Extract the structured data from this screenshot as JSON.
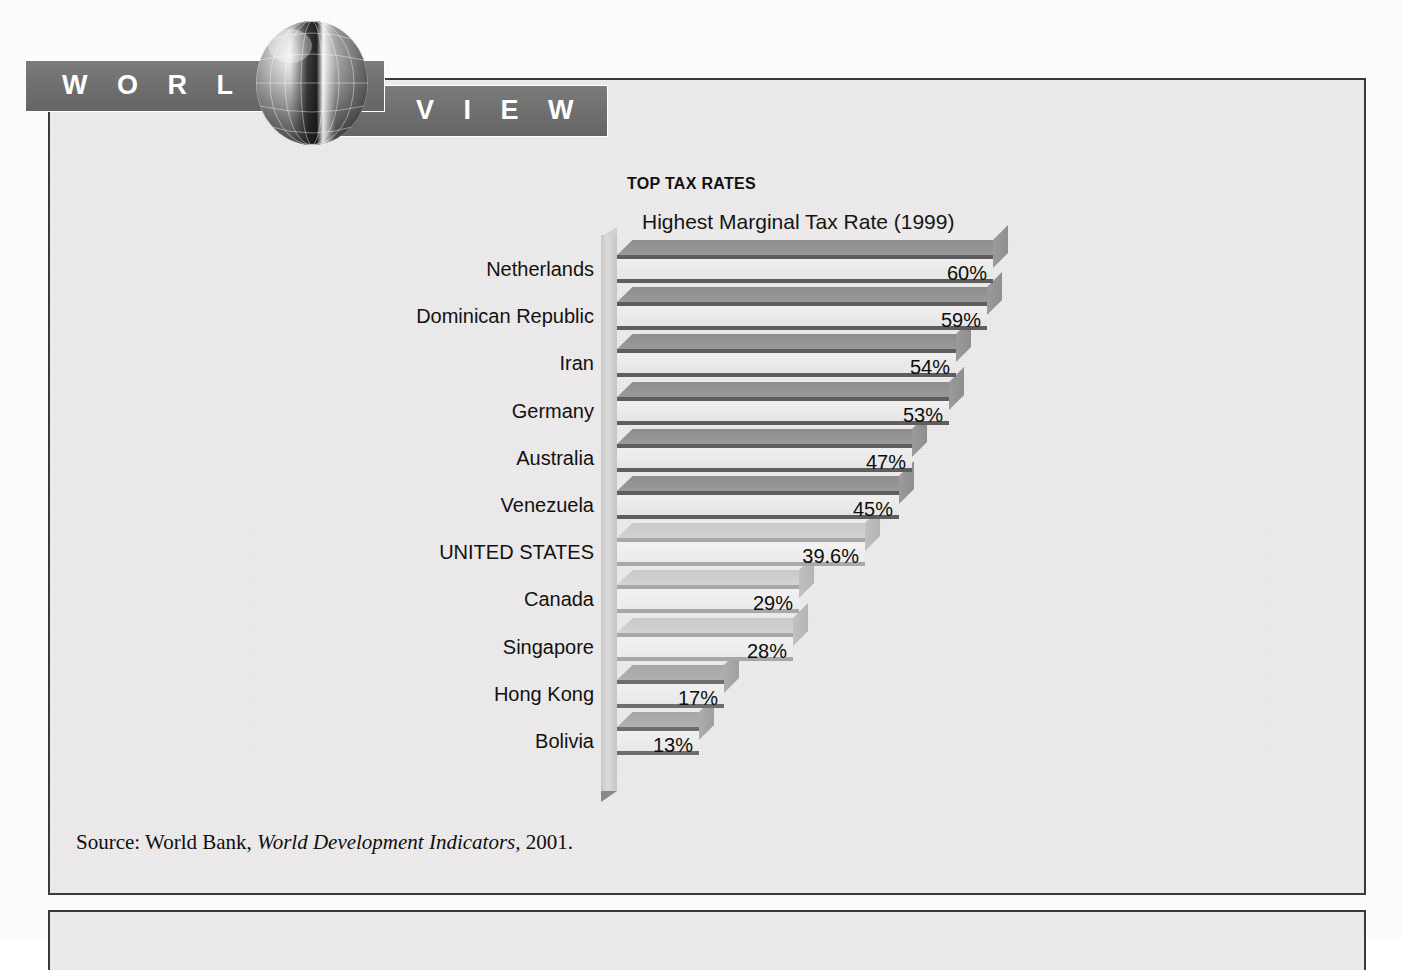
{
  "banner": {
    "word_left": "W O R L D",
    "word_right": "V I E W",
    "globe_icon": "globe-icon"
  },
  "chart_data": {
    "type": "bar",
    "orientation": "horizontal",
    "style": "3d-horizontal-bar",
    "title": "TOP TAX RATES",
    "subtitle": "Highest Marginal Tax Rate (1999)",
    "xlabel": "",
    "ylabel": "",
    "xlim": [
      0,
      60
    ],
    "grid": false,
    "legend": null,
    "categories": [
      "Netherlands",
      "Dominican Republic",
      "Iran",
      "Germany",
      "Australia",
      "Venezuela",
      "UNITED STATES",
      "Canada",
      "Singapore",
      "Hong Kong",
      "Bolivia"
    ],
    "values": [
      60,
      59,
      54,
      53,
      47,
      45,
      39.6,
      29,
      28,
      17,
      13
    ],
    "value_labels": [
      "60%",
      "59%",
      "54%",
      "53%",
      "47%",
      "45%",
      "39.6%",
      "29%",
      "28%",
      "17%",
      "13%"
    ],
    "bars": [
      {
        "label": "Netherlands",
        "value": 60,
        "value_label": "60%",
        "shade": "dark"
      },
      {
        "label": "Dominican Republic",
        "value": 59,
        "value_label": "59%",
        "shade": "dark"
      },
      {
        "label": "Iran",
        "value": 54,
        "value_label": "54%",
        "shade": "dark"
      },
      {
        "label": "Germany",
        "value": 53,
        "value_label": "53%",
        "shade": "dark"
      },
      {
        "label": "Australia",
        "value": 47,
        "value_label": "47%",
        "shade": "dark"
      },
      {
        "label": "Venezuela",
        "value": 45,
        "value_label": "45%",
        "shade": "dark"
      },
      {
        "label": "UNITED STATES",
        "value": 39.6,
        "value_label": "39.6%",
        "shade": "light"
      },
      {
        "label": "Canada",
        "value": 29,
        "value_label": "29%",
        "shade": "light"
      },
      {
        "label": "Singapore",
        "value": 28,
        "value_label": "28%",
        "shade": "light"
      },
      {
        "label": "Hong Kong",
        "value": 17,
        "value_label": "17%",
        "shade": "mid"
      },
      {
        "label": "Bolivia",
        "value": 13,
        "value_label": "13%",
        "shade": "mid"
      }
    ]
  },
  "source": {
    "prefix": "Source: World Bank,",
    "italic_title": "World Development Indicators,",
    "year": "2001."
  },
  "colors": {
    "banner_grey": "#6e6e6e",
    "frame_border": "#3a3a3a",
    "page_bg": "#eceaea",
    "bar_face": "#ececec",
    "bar_top_dark": "#939393",
    "bar_top_light": "#cecece",
    "text": "#111111"
  }
}
